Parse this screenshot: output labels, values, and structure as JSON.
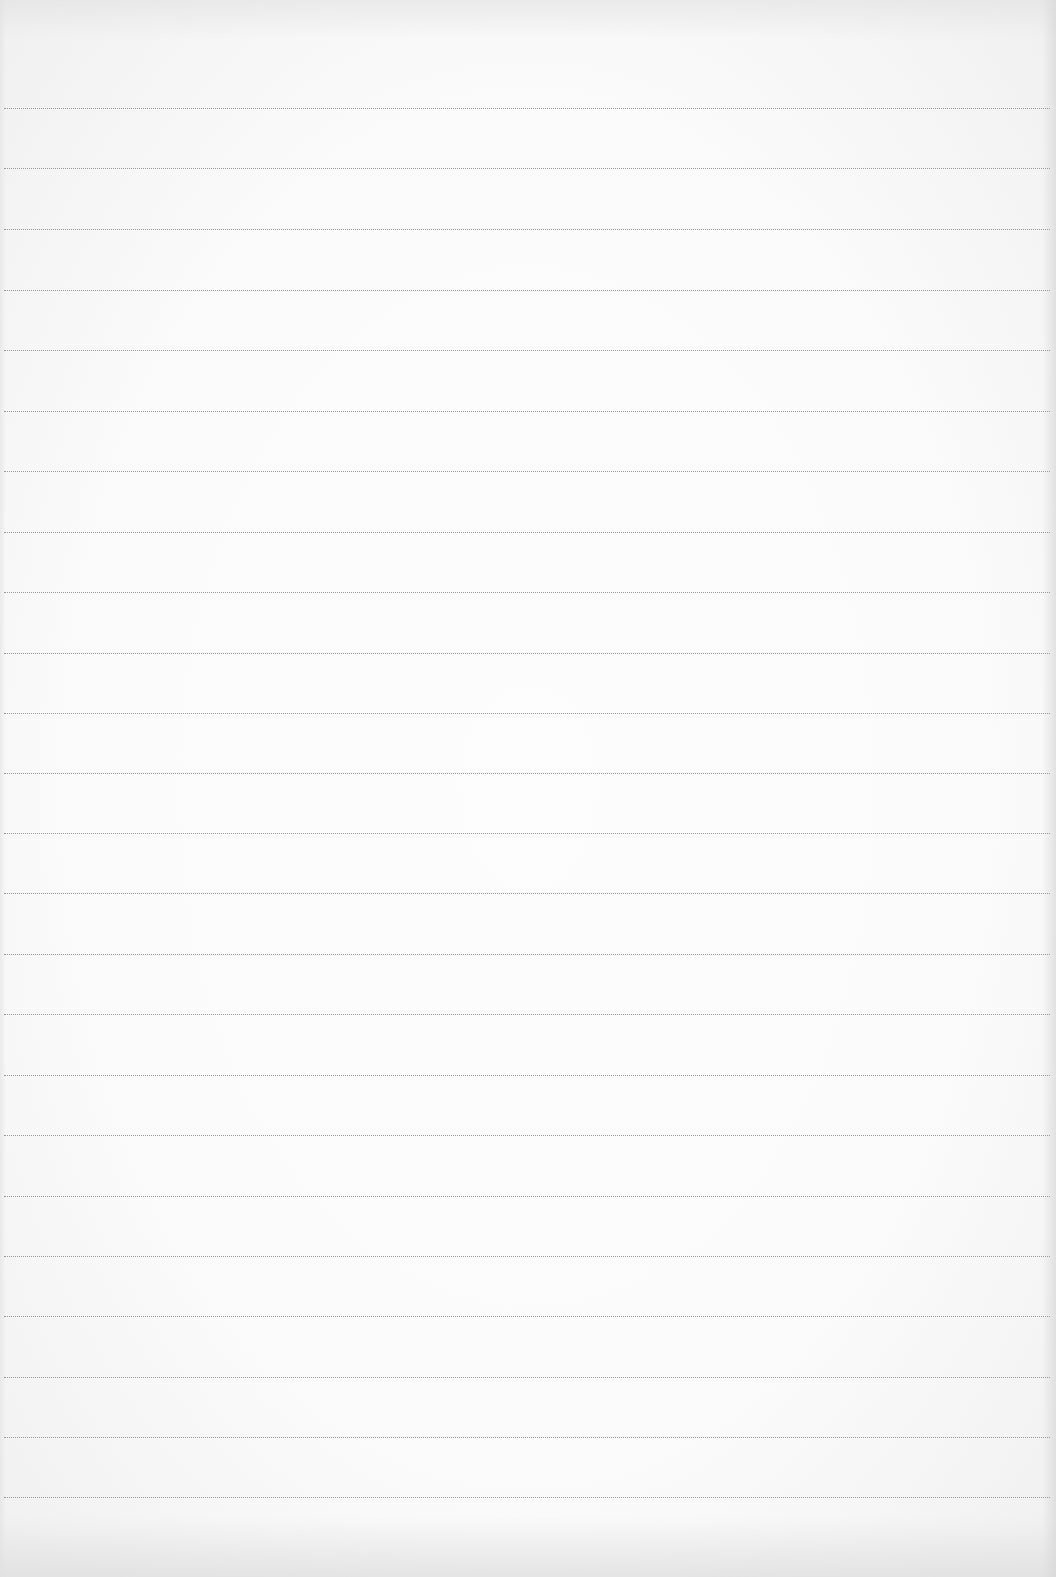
{
  "document": {
    "type": "lined-paper",
    "text": "",
    "ruled_line_count": 24,
    "ruled_line_spacing_px": 60.4,
    "ruled_line_positions_y": [
      108,
      168,
      229,
      290,
      350,
      411,
      471,
      532,
      592,
      653,
      713,
      773,
      833,
      893,
      954,
      1014,
      1075,
      1135,
      1196,
      1256,
      1316,
      1377,
      1437,
      1497
    ],
    "colors": {
      "paper": "#fbfbfb",
      "rule_line": "#9a9a9a"
    }
  }
}
